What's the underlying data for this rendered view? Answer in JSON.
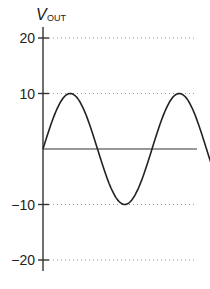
{
  "chart_data": {
    "type": "line",
    "title": "",
    "xlabel": "",
    "ylabel": "V",
    "ylabel_subscript": "OUT",
    "yticks": [
      20,
      10,
      -10,
      -20
    ],
    "ytick_labels": [
      "20",
      "10",
      "−10",
      "−20"
    ],
    "ylim": [
      -20,
      20
    ],
    "grid": {
      "style": "dotted",
      "at": [
        20,
        10,
        -10,
        -20
      ]
    },
    "series": [
      {
        "name": "V_OUT",
        "shape": "sine",
        "amplitude": 10,
        "offset": 0,
        "cycles_shown": 1.7,
        "x": [
          0,
          0.25,
          0.5,
          0.75,
          1.0,
          1.25,
          1.5,
          1.7
        ],
        "values": [
          0,
          10,
          0,
          -10,
          0,
          10,
          0,
          -5.9
        ]
      }
    ],
    "line_color": "#222222",
    "grid_color": "#999999"
  }
}
